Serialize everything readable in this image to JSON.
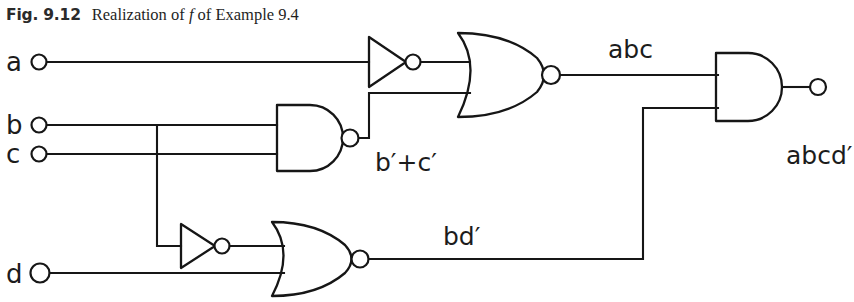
{
  "figure": {
    "caption_label": "Fig. 9.12",
    "caption_text_before": "Realization of ",
    "caption_text_italic": "f",
    "caption_text_after": " of Example 9.4",
    "background_color": "#ffffff",
    "ink_color": "#161616"
  },
  "inputs": [
    {
      "name": "a",
      "label": "a",
      "y": 62
    },
    {
      "name": "b",
      "label": "b",
      "y": 125
    },
    {
      "name": "c",
      "label": "c",
      "y": 154
    },
    {
      "name": "d",
      "label": "d",
      "y": 273
    }
  ],
  "gates": [
    {
      "name": "inverter-a",
      "type": "NOT",
      "inputs": [
        "a"
      ],
      "output": "a'"
    },
    {
      "name": "nand-bc",
      "type": "NAND",
      "inputs": [
        "b",
        "c"
      ],
      "output": "b'+c'"
    },
    {
      "name": "nor-top",
      "type": "NOR",
      "inputs": [
        "a'",
        "b'+c'"
      ],
      "output": "abc"
    },
    {
      "name": "inverter-b",
      "type": "NOT",
      "inputs": [
        "b"
      ],
      "output": "b'"
    },
    {
      "name": "nor-bottom",
      "type": "NOR",
      "inputs": [
        "b'",
        "d"
      ],
      "output": "bd'"
    },
    {
      "name": "and-out",
      "type": "AND",
      "inputs": [
        "abc",
        "bd'"
      ],
      "output": "abcd'"
    }
  ],
  "signal_labels": [
    {
      "name": "signal-label-abc",
      "text": "abc",
      "x": 608,
      "y": 58
    },
    {
      "name": "signal-label-bprime-plus-cprime",
      "text": "b′+c′",
      "x": 375,
      "y": 171
    },
    {
      "name": "signal-label-bdprime",
      "text": "bd′",
      "x": 443,
      "y": 245
    },
    {
      "name": "signal-label-abcdprime",
      "text": "abcd′",
      "x": 786,
      "y": 164
    }
  ],
  "output_terminal": {
    "name": "output-terminal",
    "x": 818,
    "y": 87
  }
}
